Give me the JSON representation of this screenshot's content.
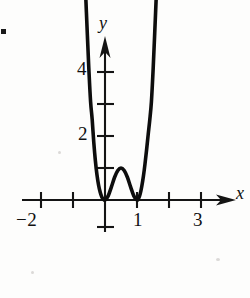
{
  "figure": {
    "kind": "cartesian-graph",
    "background_color": "#fdfdfc",
    "ink_color": "#101010",
    "corner_bullet": "▪",
    "axes": {
      "x_label": "x",
      "y_label": "y",
      "x_tick_labels": [
        "−2",
        "1",
        "3"
      ],
      "y_tick_labels": [
        "2",
        "4"
      ]
    }
  },
  "labels": {
    "neg_two": "−2",
    "one": "1",
    "three": "3",
    "two": "2",
    "four": "4",
    "x_axis": "x",
    "y_axis": "y"
  },
  "chart_data": {
    "type": "line",
    "title": "",
    "xlabel": "x",
    "ylabel": "y",
    "grid": false,
    "legend": null,
    "xlim": [
      -2.9,
      3.9
    ],
    "ylim": [
      -1.1,
      5.1
    ],
    "x_ticks": [
      -2,
      -1,
      1,
      2,
      3
    ],
    "x_tick_labels": [
      "−2",
      "",
      "1",
      "",
      "3"
    ],
    "y_ticks": [
      -1,
      1,
      2,
      3,
      4
    ],
    "y_tick_labels": [
      "",
      "",
      "2",
      "",
      "4"
    ],
    "axis_arrows": [
      "x-positive",
      "y-positive"
    ],
    "series": [
      {
        "name": "y = 16x²(x−1)²",
        "roots": [
          0,
          1
        ],
        "local_maximum": {
          "x": 0.5,
          "y": 0.25
        },
        "local_minima": [
          {
            "x": 0,
            "y": 0
          },
          {
            "x": 1,
            "y": 0
          }
        ],
        "x": [
          -0.62,
          -0.55,
          -0.5,
          -0.45,
          -0.4,
          -0.35,
          -0.3,
          -0.25,
          -0.2,
          -0.15,
          -0.1,
          -0.05,
          0,
          0.1,
          0.2,
          0.3,
          0.4,
          0.5,
          0.6,
          0.7,
          0.8,
          0.9,
          1,
          1.05,
          1.1,
          1.15,
          1.2,
          1.25,
          1.3,
          1.35,
          1.4,
          1.45,
          1.5,
          1.55,
          1.62
        ],
        "y": [
          6.8,
          5.13,
          4.0,
          3.07,
          2.51,
          1.79,
          1.22,
          0.78,
          0.46,
          0.24,
          0.097,
          0.026,
          0,
          0.13,
          0.41,
          0.71,
          0.92,
          1.0,
          0.92,
          0.71,
          0.41,
          0.13,
          0,
          0.046,
          0.19,
          0.43,
          0.74,
          1.13,
          1.57,
          2.05,
          2.51,
          3.07,
          4.0,
          5.13,
          6.8
        ]
      }
    ]
  },
  "plot_geometry": {
    "origin_px": [
      105,
      200
    ],
    "x_unit_px": 32,
    "y_unit_px": 32
  }
}
